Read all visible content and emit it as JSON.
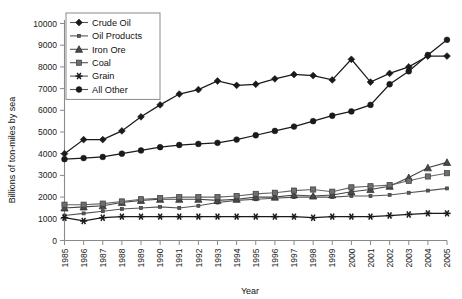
{
  "chart_data": {
    "type": "line",
    "title": "",
    "xlabel": "Year",
    "ylabel": "Billions of ton-miles by sea",
    "xlim": [
      1985,
      2005
    ],
    "ylim": [
      0,
      10000
    ],
    "ytick_step": 1000,
    "grid": false,
    "legend_position": "top-left-inside",
    "categories": [
      "1985",
      "1986",
      "1987",
      "1988",
      "1989",
      "1990",
      "1991",
      "1992",
      "1993",
      "1994",
      "1995",
      "1996",
      "1997",
      "1998",
      "1999",
      "2000",
      "2001",
      "2002",
      "2003",
      "2004",
      "2005"
    ],
    "x": [
      1985,
      1986,
      1987,
      1988,
      1989,
      1990,
      1991,
      1992,
      1993,
      1994,
      1995,
      1996,
      1997,
      1998,
      1999,
      2000,
      2001,
      2002,
      2003,
      2004,
      2005
    ],
    "yticks": [
      0,
      1000,
      2000,
      3000,
      4000,
      5000,
      6000,
      7000,
      8000,
      9000,
      10000
    ],
    "yticklabels": [
      "0",
      "1000",
      "2000",
      "3000",
      "4000",
      "5000",
      "6000",
      "7000",
      "8000",
      "9000",
      "10000"
    ],
    "series": [
      {
        "name": "Crude Oil",
        "marker": "diamond",
        "color": "#1a1a1a",
        "values": [
          4000,
          4650,
          4650,
          5050,
          5700,
          6250,
          6750,
          6950,
          7350,
          7150,
          7200,
          7450,
          7650,
          7600,
          7400,
          8350,
          7300,
          7700,
          8000,
          8500,
          8500
        ]
      },
      {
        "name": "Oil Products",
        "marker": "small-square",
        "color": "#555555",
        "values": [
          1150,
          1250,
          1350,
          1450,
          1500,
          1550,
          1500,
          1600,
          1750,
          1850,
          1900,
          1950,
          2000,
          2000,
          2000,
          2050,
          2050,
          2100,
          2200,
          2300,
          2400
        ]
      },
      {
        "name": "Iron Ore",
        "marker": "triangle",
        "color": "#444444",
        "values": [
          1500,
          1550,
          1600,
          1750,
          1850,
          1900,
          1900,
          1900,
          1850,
          1900,
          2000,
          2000,
          2100,
          2050,
          2100,
          2250,
          2350,
          2500,
          2900,
          3350,
          3600
        ]
      },
      {
        "name": "Coal",
        "marker": "square",
        "color": "#666666",
        "values": [
          1650,
          1650,
          1700,
          1800,
          1900,
          1950,
          2000,
          2000,
          2000,
          2050,
          2150,
          2200,
          2300,
          2350,
          2250,
          2450,
          2500,
          2550,
          2750,
          2950,
          3100
        ]
      },
      {
        "name": "Grain",
        "marker": "asterisk",
        "color": "#1a1a1a",
        "values": [
          1050,
          900,
          1050,
          1100,
          1100,
          1100,
          1100,
          1100,
          1100,
          1100,
          1100,
          1100,
          1100,
          1050,
          1100,
          1100,
          1100,
          1150,
          1200,
          1250,
          1250
        ]
      },
      {
        "name": "All Other",
        "marker": "circle",
        "color": "#1a1a1a",
        "values": [
          3750,
          3800,
          3850,
          4000,
          4150,
          4300,
          4400,
          4450,
          4500,
          4650,
          4850,
          5050,
          5250,
          5500,
          5750,
          5950,
          6250,
          7200,
          7800,
          8550,
          9250
        ]
      }
    ]
  },
  "legend": {
    "items": [
      {
        "label": "Crude Oil",
        "marker": "diamond"
      },
      {
        "label": "Oil Products",
        "marker": "small-square"
      },
      {
        "label": "Iron Ore",
        "marker": "triangle"
      },
      {
        "label": "Coal",
        "marker": "square"
      },
      {
        "label": "Grain",
        "marker": "asterisk"
      },
      {
        "label": "All Other",
        "marker": "circle"
      }
    ]
  },
  "axes": {
    "y_title": "Billions of ton-miles by sea",
    "x_title": "Year"
  }
}
